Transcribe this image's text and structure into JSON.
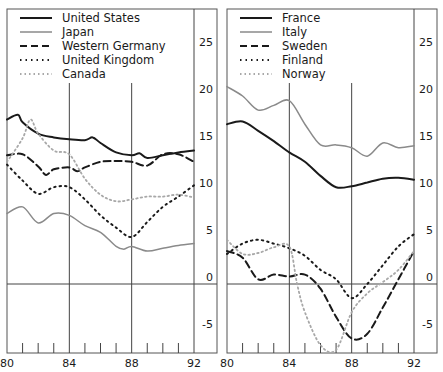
{
  "chart_data": [
    {
      "type": "line",
      "panel": "left",
      "title": "",
      "xlabel": "",
      "ylabel": "",
      "x_ticks": [
        "80",
        "84",
        "88",
        "92"
      ],
      "y_ticks": [
        "25",
        "20",
        "15",
        "10",
        "5",
        "0",
        "-5"
      ],
      "xlim": [
        1980,
        1992
      ],
      "ylim": [
        -7.5,
        27
      ],
      "grid": "vertical lines at 84, 88, 92; horizontal at 0",
      "legend_position": "top-left",
      "series": [
        {
          "name": "United States",
          "style": "solid-dark",
          "points": [
            [
              1980,
              17.5
            ],
            [
              1980.7,
              18
            ],
            [
              1981,
              17.2
            ],
            [
              1982,
              16
            ],
            [
              1983,
              15.6
            ],
            [
              1984,
              15.4
            ],
            [
              1985,
              15.3
            ],
            [
              1985.5,
              15.6
            ],
            [
              1986,
              15
            ],
            [
              1987,
              14
            ],
            [
              1988,
              13.7
            ],
            [
              1988.5,
              13.9
            ],
            [
              1989,
              13.4
            ],
            [
              1990,
              13.7
            ],
            [
              1991,
              14
            ],
            [
              1992,
              14.2
            ]
          ]
        },
        {
          "name": "Japan",
          "style": "solid-grey",
          "points": [
            [
              1980,
              7.5
            ],
            [
              1981,
              8.2
            ],
            [
              1982,
              6.5
            ],
            [
              1983,
              7.5
            ],
            [
              1984,
              7.3
            ],
            [
              1985,
              6.2
            ],
            [
              1986,
              5.5
            ],
            [
              1987,
              4
            ],
            [
              1987.5,
              3.7
            ],
            [
              1988,
              4
            ],
            [
              1989,
              3.5
            ],
            [
              1990,
              3.8
            ],
            [
              1991,
              4.1
            ],
            [
              1992,
              4.3
            ]
          ]
        },
        {
          "name": "Western Germany",
          "style": "dashed",
          "points": [
            [
              1980,
              13.7
            ],
            [
              1981,
              13.8
            ],
            [
              1982,
              12.5
            ],
            [
              1982.5,
              11.6
            ],
            [
              1983,
              12.2
            ],
            [
              1984,
              12.4
            ],
            [
              1984.5,
              12
            ],
            [
              1985,
              12.4
            ],
            [
              1986,
              13
            ],
            [
              1987,
              13.1
            ],
            [
              1988,
              13
            ],
            [
              1989,
              12.6
            ],
            [
              1990,
              13.8
            ],
            [
              1991,
              13.8
            ],
            [
              1992,
              13
            ]
          ]
        },
        {
          "name": "United Kingdom",
          "style": "dotted-dark",
          "points": [
            [
              1980,
              12.7
            ],
            [
              1981,
              11
            ],
            [
              1982,
              9.6
            ],
            [
              1983,
              10.3
            ],
            [
              1984,
              10.3
            ],
            [
              1985,
              9
            ],
            [
              1986,
              7.3
            ],
            [
              1987,
              6
            ],
            [
              1988,
              5
            ],
            [
              1989,
              6.6
            ],
            [
              1990,
              8.2
            ],
            [
              1991,
              9.3
            ],
            [
              1992,
              10.5
            ]
          ]
        },
        {
          "name": "Canada",
          "style": "dotted-grey",
          "points": [
            [
              1980,
              13
            ],
            [
              1981,
              15.5
            ],
            [
              1981.5,
              17.5
            ],
            [
              1982,
              16
            ],
            [
              1983,
              14.2
            ],
            [
              1984,
              13.8
            ],
            [
              1985,
              11.2
            ],
            [
              1986,
              9.5
            ],
            [
              1987,
              8.8
            ],
            [
              1988,
              9
            ],
            [
              1989,
              9.3
            ],
            [
              1990,
              9.3
            ],
            [
              1991,
              9.5
            ],
            [
              1992,
              9.2
            ]
          ]
        }
      ]
    },
    {
      "type": "line",
      "panel": "right",
      "title": "",
      "xlabel": "",
      "ylabel": "",
      "x_ticks": [
        "80",
        "84",
        "88",
        "92"
      ],
      "y_ticks": [
        "25",
        "20",
        "15",
        "10",
        "5",
        "0",
        "-5"
      ],
      "xlim": [
        1980,
        1992
      ],
      "ylim": [
        -7.5,
        27
      ],
      "grid": "vertical lines at 84, 88, 92; horizontal at 0",
      "legend_position": "top-left",
      "series": [
        {
          "name": "France",
          "style": "solid-dark",
          "points": [
            [
              1980,
              17
            ],
            [
              1981,
              17.3
            ],
            [
              1982,
              16.3
            ],
            [
              1983,
              15.2
            ],
            [
              1984,
              14
            ],
            [
              1985,
              13
            ],
            [
              1986,
              11.5
            ],
            [
              1987,
              10.3
            ],
            [
              1988,
              10.4
            ],
            [
              1989,
              10.8
            ],
            [
              1990,
              11.2
            ],
            [
              1991,
              11.3
            ],
            [
              1992,
              11.1
            ]
          ]
        },
        {
          "name": "Italy",
          "style": "solid-grey",
          "points": [
            [
              1980,
              21
            ],
            [
              1981,
              20
            ],
            [
              1982,
              18.5
            ],
            [
              1983,
              19
            ],
            [
              1984,
              19.5
            ],
            [
              1985,
              17
            ],
            [
              1986,
              14.8
            ],
            [
              1987,
              14.8
            ],
            [
              1988,
              14.5
            ],
            [
              1989,
              13.6
            ],
            [
              1990,
              15
            ],
            [
              1991,
              14.5
            ],
            [
              1992,
              14.7
            ]
          ]
        },
        {
          "name": "Sweden",
          "style": "dashed",
          "points": [
            [
              1980,
              3.5
            ],
            [
              1981,
              2.8
            ],
            [
              1982,
              0.5
            ],
            [
              1983,
              1
            ],
            [
              1984,
              0.8
            ],
            [
              1985,
              1
            ],
            [
              1986,
              -0.5
            ],
            [
              1987,
              -3.5
            ],
            [
              1988,
              -5.8
            ],
            [
              1989,
              -5.3
            ],
            [
              1990,
              -2.5
            ],
            [
              1991,
              0.5
            ],
            [
              1992,
              3.5
            ]
          ]
        },
        {
          "name": "Finland",
          "style": "dotted-dark",
          "points": [
            [
              1980,
              3.2
            ],
            [
              1981,
              4.3
            ],
            [
              1982,
              4.7
            ],
            [
              1983,
              4.3
            ],
            [
              1984,
              3.8
            ],
            [
              1985,
              3
            ],
            [
              1986,
              1.5
            ],
            [
              1987,
              0.5
            ],
            [
              1988,
              -1.5
            ],
            [
              1989,
              0
            ],
            [
              1990,
              2
            ],
            [
              1991,
              4
            ],
            [
              1992,
              5.3
            ]
          ]
        },
        {
          "name": "Norway",
          "style": "dotted-grey",
          "points": [
            [
              1980,
              4.7
            ],
            [
              1981,
              3.2
            ],
            [
              1982,
              3.3
            ],
            [
              1983,
              3.9
            ],
            [
              1984,
              4
            ],
            [
              1984.5,
              0
            ],
            [
              1985,
              -3
            ],
            [
              1986,
              -6.5
            ],
            [
              1987,
              -7
            ],
            [
              1988,
              -3
            ],
            [
              1989,
              -1
            ],
            [
              1990,
              0.2
            ],
            [
              1991,
              1.5
            ],
            [
              1992,
              3.5
            ]
          ]
        }
      ]
    }
  ],
  "legends": {
    "left": [
      "United States",
      "Japan",
      "Western Germany",
      "United Kingdom",
      "Canada"
    ],
    "right": [
      "France",
      "Italy",
      "Sweden",
      "Finland",
      "Norway"
    ]
  },
  "axis": {
    "x_ticks": [
      "80",
      "84",
      "88",
      "92"
    ],
    "y_ticks": [
      "25",
      "20",
      "15",
      "10",
      "5",
      "0",
      "-5"
    ]
  },
  "styles": {
    "solid-dark": {
      "color": "#1a1a1a",
      "width": 2.0,
      "dash": ""
    },
    "solid-grey": {
      "color": "#8a8a8a",
      "width": 1.5,
      "dash": ""
    },
    "dashed": {
      "color": "#1a1a1a",
      "width": 2.0,
      "dash": "7,4"
    },
    "dotted-dark": {
      "color": "#1a1a1a",
      "width": 2.0,
      "dash": "1.5,4"
    },
    "dotted-grey": {
      "color": "#a8a8a8",
      "width": 1.8,
      "dash": "1.5,3"
    }
  }
}
